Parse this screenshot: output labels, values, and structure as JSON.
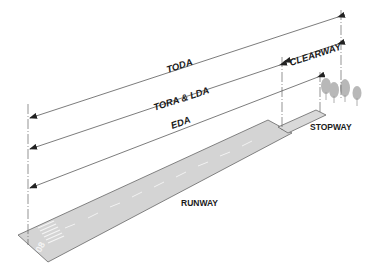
{
  "diagram": {
    "distances": [
      {
        "id": "toda",
        "label": "TODA"
      },
      {
        "id": "tora_lda",
        "label": "TORA & LDA"
      },
      {
        "id": "eda",
        "label": "EDA"
      },
      {
        "id": "clearway",
        "label": "CLEARWAY"
      }
    ],
    "areas": {
      "runway": "RUNWAY",
      "stopway": "STOPWAY"
    },
    "runway_designator": "08",
    "colors": {
      "runway_fill": "#d4d4d4",
      "stopway_fill": "#d9d9d9",
      "tree_fill": "#b8b8b8",
      "line": "#555555",
      "text": "#1a1a1a"
    }
  }
}
